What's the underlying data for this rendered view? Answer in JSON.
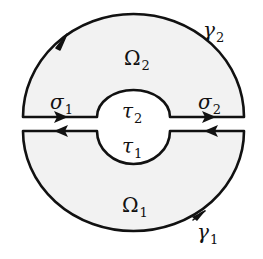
{
  "diagram": {
    "type": "annulus-split-contour",
    "colors": {
      "fill": "#f2f2f2",
      "stroke": "#111111",
      "background": "#ffffff"
    },
    "regions": [
      {
        "id": "omega2",
        "label": "Ω",
        "sub": "2"
      },
      {
        "id": "omega1",
        "label": "Ω",
        "sub": "1"
      }
    ],
    "curves": [
      {
        "id": "gamma2",
        "label": "γ",
        "sub": "2",
        "arrow": "counterclockwise"
      },
      {
        "id": "gamma1",
        "label": "γ",
        "sub": "1",
        "arrow": "counterclockwise"
      },
      {
        "id": "sigma1",
        "label": "σ",
        "sub": "1",
        "arrow": "right"
      },
      {
        "id": "sigma2",
        "label": "σ",
        "sub": "2",
        "arrow": "right"
      },
      {
        "id": "tau2",
        "label": "τ",
        "sub": "2"
      },
      {
        "id": "tau1",
        "label": "τ",
        "sub": "1"
      }
    ]
  },
  "labels": {
    "omega2": {
      "main": "Ω",
      "sub": "2"
    },
    "omega1": {
      "main": "Ω",
      "sub": "1"
    },
    "gamma2": {
      "main": "γ",
      "sub": "2"
    },
    "gamma1": {
      "main": "γ",
      "sub": "1"
    },
    "sigma1": {
      "main": "σ",
      "sub": "1"
    },
    "sigma2": {
      "main": "σ",
      "sub": "2"
    },
    "tau2": {
      "main": "τ",
      "sub": "2"
    },
    "tau1": {
      "main": "τ",
      "sub": "1"
    }
  }
}
